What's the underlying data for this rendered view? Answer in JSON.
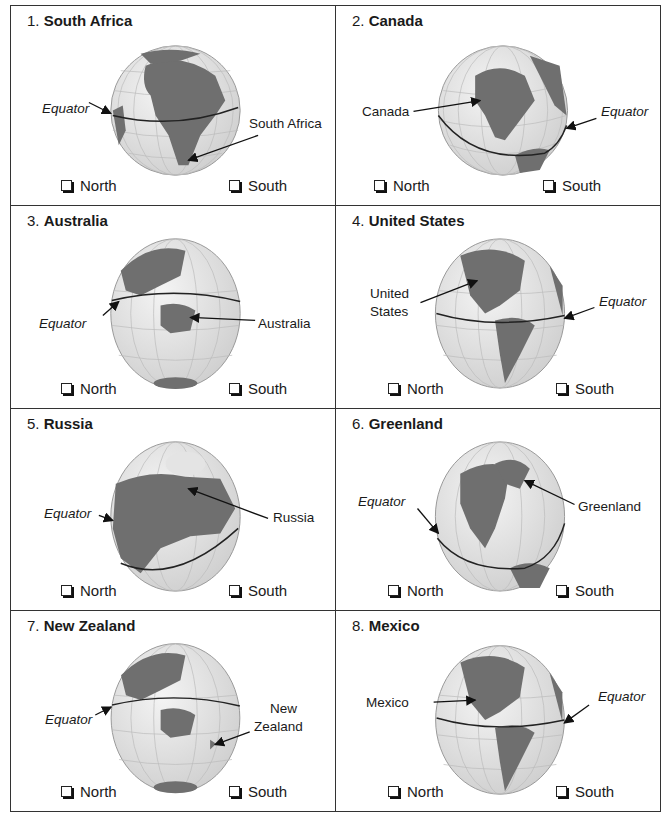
{
  "options": {
    "north": "North",
    "south": "South"
  },
  "equator_label": "Equator",
  "colors": {
    "land": "#6f6f6f",
    "ocean": "#e6e6e6",
    "grid": "#b8b8b8",
    "border": "#333333"
  },
  "cells": [
    {
      "number": "1.",
      "name": "South Africa",
      "pointer_label": "South Africa"
    },
    {
      "number": "2.",
      "name": "Canada",
      "pointer_label": "Canada"
    },
    {
      "number": "3.",
      "name": "Australia",
      "pointer_label": "Australia"
    },
    {
      "number": "4.",
      "name": "United States",
      "pointer_label_line1": "United",
      "pointer_label_line2": "States"
    },
    {
      "number": "5.",
      "name": "Russia",
      "pointer_label": "Russia"
    },
    {
      "number": "6.",
      "name": "Greenland",
      "pointer_label": "Greenland"
    },
    {
      "number": "7.",
      "name": "New Zealand",
      "pointer_label_line1": "New",
      "pointer_label_line2": "Zealand"
    },
    {
      "number": "8.",
      "name": "Mexico",
      "pointer_label": "Mexico"
    }
  ]
}
